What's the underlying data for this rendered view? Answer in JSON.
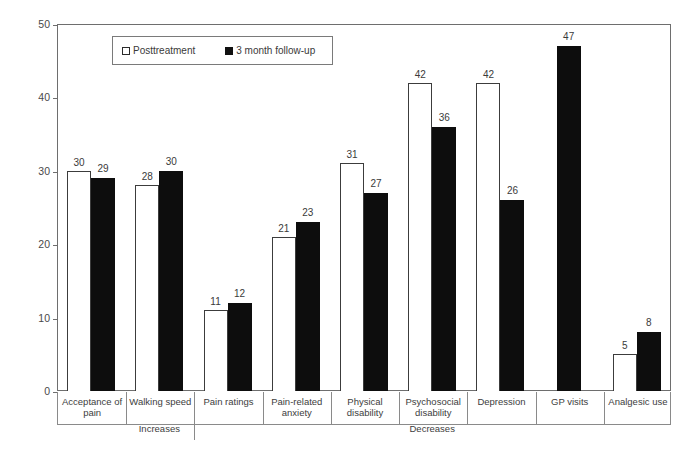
{
  "chart_data": {
    "type": "bar",
    "title": "",
    "subtitle": "",
    "xlabel": "",
    "ylabel": "Percentage improvement",
    "ylim": [
      0,
      50
    ],
    "yticks": [
      0,
      10,
      20,
      30,
      40,
      50
    ],
    "grid": false,
    "legend_position": "top-left-inside",
    "categories": [
      "Acceptance of pain",
      "Walking speed",
      "Pain ratings",
      "Pain-related anxiety",
      "Physical disability",
      "Psychosocial disability",
      "Depression",
      "GP visits",
      "Analgesic use"
    ],
    "category_lines": [
      [
        "Acceptance of",
        "pain"
      ],
      [
        "Walking speed"
      ],
      [
        "Pain ratings"
      ],
      [
        "Pain-related",
        "anxiety"
      ],
      [
        "Physical",
        "disability"
      ],
      [
        "Psychosocial",
        "disability"
      ],
      [
        "Depression"
      ],
      [
        "GP visits"
      ],
      [
        "Analgesic use"
      ]
    ],
    "series": [
      {
        "name": "Posttreatment",
        "color": "#ffffff",
        "edge_color": "#3c3c3c",
        "values": [
          30,
          28,
          11,
          21,
          31,
          42,
          42,
          null,
          5
        ]
      },
      {
        "name": "3 month follow-up",
        "color": "#0d0d0d",
        "edge_color": "#0d0d0d",
        "values": [
          29,
          30,
          12,
          23,
          27,
          36,
          26,
          47,
          8
        ]
      }
    ],
    "group_annotations": [
      {
        "label": "Increases",
        "spans_categories": [
          "Acceptance of pain",
          "Walking speed"
        ]
      },
      {
        "label": "Decreases",
        "spans_categories": [
          "Pain ratings",
          "Pain-related anxiety",
          "Physical disability",
          "Psychosocial disability",
          "Depression",
          "GP visits",
          "Analgesic use"
        ]
      }
    ]
  },
  "legend": {
    "items": [
      {
        "label": "Posttreatment",
        "swatch": "open-square-icon"
      },
      {
        "label": "3 month follow-up",
        "swatch": "filled-square-icon"
      }
    ]
  },
  "axes": {
    "y_title": "Percentage improvement",
    "y_tick_labels": [
      "50",
      "40",
      "30",
      "20",
      "10",
      "0"
    ]
  },
  "annotations": {
    "increases": "Increases",
    "decreases": "Decreases"
  }
}
